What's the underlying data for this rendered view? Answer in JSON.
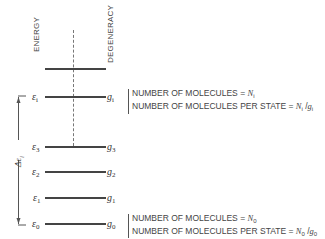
{
  "axis_labels": {
    "energy": "ENERGY",
    "degeneracy": "DEGENERACY"
  },
  "levels": [
    {
      "id": "top",
      "energy": "",
      "energy_sub": "",
      "deg": "",
      "deg_sub": "",
      "y": 69
    },
    {
      "id": "i",
      "energy": "ε",
      "energy_sub": "i",
      "deg": "g",
      "deg_sub": "i",
      "y": 97
    },
    {
      "id": "3",
      "energy": "ε",
      "energy_sub": "3",
      "deg": "g",
      "deg_sub": "3",
      "y": 147
    },
    {
      "id": "2",
      "energy": "ε",
      "energy_sub": "2",
      "deg": "g",
      "deg_sub": "2",
      "y": 172
    },
    {
      "id": "1",
      "energy": "ε",
      "energy_sub": "1",
      "deg": "g",
      "deg_sub": "1",
      "y": 198
    },
    {
      "id": "0",
      "energy": "ε",
      "energy_sub": "0",
      "deg": "g",
      "deg_sub": "0",
      "y": 224
    }
  ],
  "delta_label": {
    "symbol": "Δε",
    "sub": "i"
  },
  "notes": {
    "level_i": {
      "line1_text": "NUMBER OF MOLECULES = ",
      "line1_var": "N",
      "line1_sub": "i",
      "line2_text": "NUMBER OF MOLECULES PER STATE = ",
      "line2_var1": "N",
      "line2_sub1": "i",
      "line2_mid": " /",
      "line2_var2": "g",
      "line2_sub2": "i"
    },
    "level_0": {
      "line1_text": "NUMBER OF MOLECULES = ",
      "line1_var": "N",
      "line1_sub": "0",
      "line2_text": "NUMBER OF MOLECULES PER STATE = ",
      "line2_var1": "N",
      "line2_sub1": "0",
      "line2_mid": " /",
      "line2_var2": "g",
      "line2_sub2": "0"
    }
  }
}
